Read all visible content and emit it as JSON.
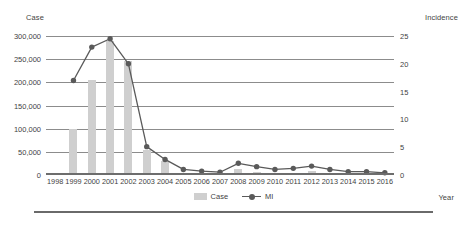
{
  "chart_data": {
    "type": "bar",
    "title": "",
    "subtitle": "",
    "xlabel": "Year",
    "ylabel": "Case",
    "y2label": "Incidence",
    "categories": [
      "1998",
      "1999",
      "2000",
      "2001",
      "2002",
      "2003",
      "2004",
      "2005",
      "2006",
      "2007",
      "2008",
      "2009",
      "2010",
      "2011",
      "2012",
      "2013",
      "2014",
      "2015",
      "2016"
    ],
    "ylim": [
      0,
      300000
    ],
    "y2lim": [
      0,
      25
    ],
    "yticks": [
      "0",
      "50,000",
      "100,000",
      "150,000",
      "200,000",
      "250,000",
      "300,000"
    ],
    "ytick_values": [
      0,
      50000,
      100000,
      150000,
      200000,
      250000,
      300000
    ],
    "y2ticks": [
      "0",
      "5",
      "10",
      "15",
      "20",
      "25"
    ],
    "y2tick_values": [
      0,
      5,
      10,
      15,
      20,
      25
    ],
    "grid": true,
    "legend_position": "bottom-center",
    "series": [
      {
        "name": "Case",
        "type": "bar",
        "axis": "left",
        "color": "#cfcfcf",
        "values": [
          0,
          100000,
          205000,
          290000,
          245000,
          55000,
          30000,
          3000,
          2000,
          1500,
          14000,
          6000,
          3000,
          5000,
          9000,
          4000,
          2000,
          2000,
          1500
        ]
      },
      {
        "name": "MI",
        "type": "line",
        "axis": "right",
        "color": "#5a5a5a",
        "values": [
          null,
          17.0,
          23.0,
          24.5,
          20.0,
          5.1,
          2.8,
          1.0,
          0.7,
          0.5,
          2.1,
          1.5,
          1.0,
          1.2,
          1.6,
          1.0,
          0.6,
          0.6,
          0.4
        ]
      }
    ],
    "legend": [
      {
        "label": "Case",
        "marker": "bar-swatch",
        "color": "#cfcfcf"
      },
      {
        "label": "MI",
        "marker": "line-circle",
        "color": "#5a5a5a"
      }
    ]
  }
}
